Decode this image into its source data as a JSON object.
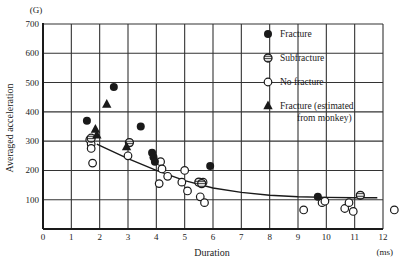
{
  "chart_data": {
    "type": "scatter",
    "title": "",
    "xlabel": "Duration",
    "xunit": "(ms)",
    "ylabel": "Averaged acceleration",
    "yunit": "(G)",
    "xlim": [
      0,
      12
    ],
    "ylim": [
      0,
      700
    ],
    "xticks": [
      0,
      1,
      2,
      3,
      4,
      5,
      6,
      7,
      8,
      9,
      10,
      11,
      12
    ],
    "yticks": [
      100,
      200,
      300,
      400,
      500,
      600,
      700
    ],
    "y_zero_label": "0",
    "grid": true,
    "legend_position": "upper right",
    "series": [
      {
        "name": "Fracture",
        "marker": "filled-circle",
        "points": [
          [
            1.55,
            370
          ],
          [
            2.5,
            485
          ],
          [
            3.45,
            350
          ],
          [
            3.85,
            260
          ],
          [
            3.9,
            245
          ],
          [
            3.95,
            230
          ],
          [
            5.9,
            215
          ],
          [
            9.7,
            110
          ]
        ]
      },
      {
        "name": "Subfracture",
        "marker": "hatched-circle",
        "points": [
          [
            1.7,
            310
          ],
          [
            3.05,
            295
          ],
          [
            5.5,
            160
          ],
          [
            5.6,
            155
          ],
          [
            11.2,
            115
          ]
        ]
      },
      {
        "name": "No fracture",
        "marker": "open-circle",
        "points": [
          [
            1.65,
            305
          ],
          [
            1.7,
            290
          ],
          [
            1.7,
            275
          ],
          [
            1.75,
            225
          ],
          [
            3.0,
            250
          ],
          [
            4.15,
            230
          ],
          [
            4.2,
            205
          ],
          [
            4.1,
            155
          ],
          [
            4.4,
            180
          ],
          [
            5.0,
            200
          ],
          [
            4.9,
            160
          ],
          [
            5.1,
            130
          ],
          [
            5.55,
            110
          ],
          [
            5.65,
            160
          ],
          [
            5.7,
            90
          ],
          [
            9.2,
            65
          ],
          [
            9.85,
            90
          ],
          [
            9.95,
            95
          ],
          [
            10.65,
            70
          ],
          [
            10.8,
            90
          ],
          [
            10.95,
            60
          ],
          [
            12.4,
            65
          ]
        ]
      },
      {
        "name": "Fracture (estimated from monkey)",
        "marker": "filled-triangle",
        "points": [
          [
            1.85,
            340
          ],
          [
            1.9,
            320
          ],
          [
            2.25,
            425
          ],
          [
            2.95,
            280
          ]
        ]
      }
    ],
    "fit_curve": {
      "type": "line",
      "description": "Fitted decreasing curve",
      "points": [
        [
          1.9,
          290
        ],
        [
          3,
          240
        ],
        [
          4,
          200
        ],
        [
          5,
          165
        ],
        [
          6,
          140
        ],
        [
          7,
          125
        ],
        [
          8,
          115
        ],
        [
          9,
          110
        ],
        [
          10,
          108
        ],
        [
          11,
          107
        ],
        [
          11.8,
          107
        ]
      ]
    },
    "legend": [
      {
        "label": "Fracture",
        "marker": "filled-circle"
      },
      {
        "label": "Subfracture",
        "marker": "hatched-circle"
      },
      {
        "label": "No fracture",
        "marker": "open-circle"
      },
      {
        "label": "Fracture (estimated",
        "label_line2": "from monkey)",
        "marker": "filled-triangle"
      }
    ]
  },
  "colors": {
    "ink": "#1a1a1a",
    "grid": "#333333",
    "background": "#ffffff"
  }
}
